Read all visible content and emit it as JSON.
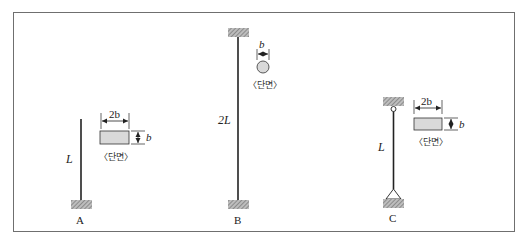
{
  "figure": {
    "colors": {
      "frame": "#6f6f6f",
      "member": "#222222",
      "section_fill": "#d9d9d9",
      "hatch": "#888888"
    },
    "columns": [
      {
        "id": "A",
        "label": "A",
        "length_label": "L",
        "top_support": "free",
        "bottom_support": "fixed",
        "section": {
          "shape": "rectangle",
          "width_label": "2b",
          "height_label": "b",
          "caption": "〈단면〉"
        }
      },
      {
        "id": "B",
        "label": "B",
        "length_label": "2L",
        "top_support": "fixed",
        "bottom_support": "fixed",
        "section": {
          "shape": "circle",
          "diameter_label": "b",
          "caption": "〈단면〉"
        }
      },
      {
        "id": "C",
        "label": "C",
        "length_label": "L",
        "top_support": "pinned",
        "bottom_support": "pinned",
        "section": {
          "shape": "rectangle",
          "width_label": "2b",
          "height_label": "b",
          "caption": "〈단면〉"
        }
      }
    ]
  }
}
